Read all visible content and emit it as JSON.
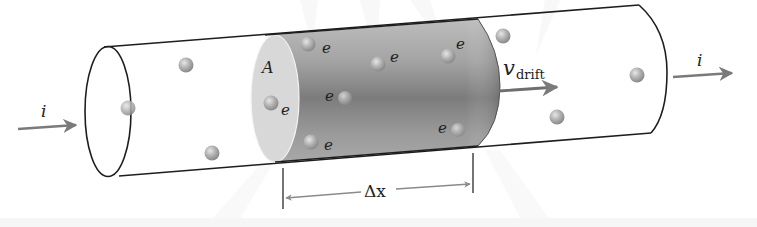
{
  "diagram": {
    "type": "physics-illustration",
    "labels": {
      "current_in": "i",
      "current_out": "i",
      "area": "A",
      "electron": "e",
      "drift_velocity_symbol": "v",
      "drift_velocity_subscript": "drift",
      "length_symbol": "Δx"
    },
    "colors": {
      "outline": "#1e1e1e",
      "arrow": "#7a7a7a",
      "sphere_light": "#cfcfcf",
      "sphere_dark": "#8c8c8c",
      "section_light": "#d9d9d9",
      "section_dark": "#7d7d7d",
      "background": "#ffffff"
    },
    "electrons_inside_section": [
      {
        "x": 308,
        "y": 44,
        "label": "e"
      },
      {
        "x": 378,
        "y": 64,
        "label": "e"
      },
      {
        "x": 448,
        "y": 56,
        "label": "e"
      },
      {
        "x": 271,
        "y": 103,
        "label": "e"
      },
      {
        "x": 345,
        "y": 98,
        "label": "e"
      },
      {
        "x": 311,
        "y": 142,
        "label": "e"
      },
      {
        "x": 458,
        "y": 130,
        "label": "e"
      }
    ],
    "electrons_outside_section": [
      {
        "x": 186,
        "y": 65
      },
      {
        "x": 128,
        "y": 108
      },
      {
        "x": 212,
        "y": 153
      },
      {
        "x": 503,
        "y": 36
      },
      {
        "x": 637,
        "y": 75
      },
      {
        "x": 557,
        "y": 117
      }
    ]
  }
}
